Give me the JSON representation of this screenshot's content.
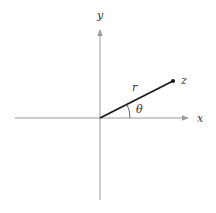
{
  "diagram": {
    "axes": {
      "x_label": "x",
      "y_label": "y",
      "axis_color": "#9a9a9a"
    },
    "vector": {
      "length_label": "r",
      "point_label": "z",
      "angle_label": "θ",
      "color": "#1a1a1a"
    }
  }
}
